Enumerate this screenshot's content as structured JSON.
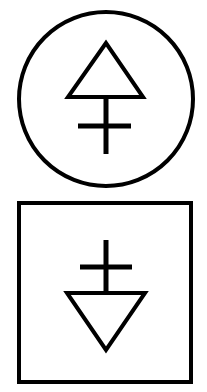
{
  "diagram": {
    "symbols": [
      {
        "name": "circle-symbol",
        "frame": "circle",
        "glyph": "upward triangle with crossed stem"
      },
      {
        "name": "square-symbol",
        "frame": "square",
        "glyph": "downward triangle with crossed stem"
      }
    ],
    "colors": {
      "stroke": "#000000",
      "background": "#ffffff"
    }
  }
}
